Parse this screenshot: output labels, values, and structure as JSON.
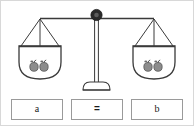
{
  "figure": {
    "colors": {
      "outline": "#3a3a3a",
      "fulcrum": "#2b2b2b",
      "apple_fill": "#8c8c8c",
      "apple_outline": "#4a4a4a",
      "box_border": "#9a9a9a",
      "frame": "#d8d8d8",
      "background": "#ffffff",
      "text": "#1a1a1a"
    }
  },
  "scale": {
    "fulcrum_label": "fulcrum-knob",
    "beam_label": "balance-beam",
    "post_label": "center-post",
    "base_label": "scale-base",
    "left_pan": {
      "name": "left-pan",
      "item_count": 2,
      "item_label": "apple"
    },
    "right_pan": {
      "name": "right-pan",
      "item_count": 2,
      "item_label": "apple"
    }
  },
  "equation": {
    "boxes": [
      {
        "name": "left-term-box",
        "text": "a"
      },
      {
        "name": "operator-box",
        "text": "="
      },
      {
        "name": "right-term-box",
        "text": "b"
      }
    ]
  }
}
